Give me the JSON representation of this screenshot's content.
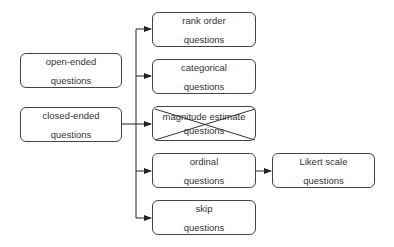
{
  "diagram": {
    "left_nodes": [
      {
        "id": "open-ended",
        "line1": "open-ended",
        "line2": "questions"
      },
      {
        "id": "closed-ended",
        "line1": "closed-ended",
        "line2": "questions"
      }
    ],
    "closed_children": [
      {
        "id": "rank-order",
        "line1": "rank order",
        "line2": "questions",
        "crossed_out": false
      },
      {
        "id": "categorical",
        "line1": "categorical",
        "line2": "questions",
        "crossed_out": false
      },
      {
        "id": "magnitude-estimate",
        "line1": "magnitude estimate",
        "line2": "questions",
        "crossed_out": true
      },
      {
        "id": "ordinal",
        "line1": "ordinal",
        "line2": "questions",
        "crossed_out": false
      },
      {
        "id": "skip",
        "line1": "skip",
        "line2": "questions",
        "crossed_out": false
      }
    ],
    "ordinal_children": [
      {
        "id": "likert-scale",
        "line1": "Likert scale",
        "line2": "questions"
      }
    ],
    "colors": {
      "border": "#444444",
      "text": "#333333",
      "line": "#222222"
    }
  }
}
